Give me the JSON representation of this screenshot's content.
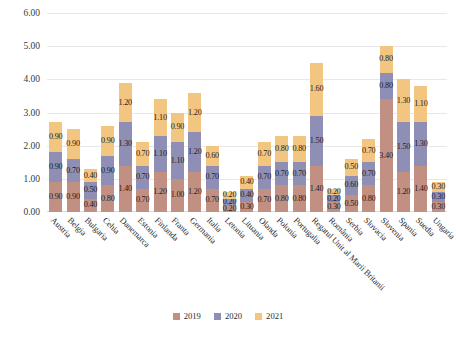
{
  "chart_data": {
    "type": "bar",
    "subtype": "stacked-bar",
    "title": "",
    "xlabel": "",
    "ylabel": "",
    "ylim": [
      0,
      6
    ],
    "yticks": [
      "0.00",
      "1.00",
      "2.00",
      "3.00",
      "4.00",
      "5.00",
      "6.00"
    ],
    "ytick_values": [
      0,
      1,
      2,
      3,
      4,
      5,
      6
    ],
    "grid": true,
    "legend_position": "bottom",
    "colors": {
      "2019": "#c29083",
      "2020": "#8f8fb5",
      "2021": "#f2c581"
    },
    "categories": [
      "Austria",
      "Belgia",
      "Bulgaria",
      "Cehia",
      "Danemarca",
      "Estonia",
      "Finlanda",
      "Franta",
      "Germania",
      "Italia",
      "Letonia",
      "Lituania",
      "Olanda",
      "Polonia",
      "Portugalia",
      "Regatul Unit al Marii Britanii",
      "România",
      "Serbia",
      "Slovacia",
      "Slovenia",
      "Spania",
      "Suedia",
      "Ungaria"
    ],
    "series": [
      {
        "name": "2019",
        "values": [
          0.9,
          0.9,
          0.4,
          0.8,
          1.4,
          0.7,
          1.2,
          1.0,
          1.2,
          0.7,
          0.2,
          0.3,
          0.7,
          0.8,
          0.8,
          1.4,
          0.3,
          0.5,
          0.8,
          3.4,
          1.2,
          1.4,
          0.3
        ],
        "labels": [
          "0.90",
          "0.90",
          "0.40",
          "0.80",
          "1.40",
          "0.70",
          "1.20",
          "1.00",
          "1.20",
          "0.70",
          "0.20",
          "0.30",
          "0.70",
          "0.80",
          "0.80",
          "1.40",
          "0.30",
          "0.50",
          "0.80",
          "3.40",
          "1.20",
          "1.40",
          "0.30"
        ]
      },
      {
        "name": "2020",
        "values": [
          0.9,
          0.7,
          0.5,
          0.9,
          1.3,
          0.7,
          1.1,
          1.1,
          1.2,
          0.7,
          0.2,
          0.4,
          0.7,
          0.7,
          0.7,
          1.5,
          0.2,
          0.6,
          0.7,
          0.8,
          1.5,
          1.3,
          0.3
        ],
        "labels": [
          "0.90",
          "0.70",
          "0.50",
          "0.90",
          "1.30",
          "0.70",
          "1.10",
          "1.10",
          "1.20",
          "0.70",
          "0.20",
          "0.40",
          "0.70",
          "0.70",
          "0.70",
          "1.50",
          "0.20",
          "0.60",
          "0.70",
          "0.80",
          "1.50",
          "1.30",
          "0.30"
        ]
      },
      {
        "name": "2021",
        "values": [
          0.9,
          0.9,
          0.4,
          0.9,
          1.2,
          0.7,
          1.1,
          0.9,
          1.2,
          0.6,
          0.2,
          0.4,
          0.7,
          0.8,
          0.8,
          1.6,
          0.2,
          0.5,
          0.7,
          0.8,
          1.3,
          1.1,
          0.3
        ],
        "labels": [
          "0.90",
          "0.90",
          "0.40",
          "0.90",
          "1.20",
          "0.70",
          "1.10",
          "0.90",
          "1.20",
          "0.60",
          "0.20",
          "0.40",
          "0.70",
          "0.80",
          "0.80",
          "1.60",
          "0.20",
          "0.50",
          "0.70",
          "0.80",
          "1.30",
          "1.10",
          "0.30"
        ]
      }
    ]
  },
  "legend": {
    "items": [
      {
        "label": "2019",
        "key": "s2019"
      },
      {
        "label": "2020",
        "key": "s2020"
      },
      {
        "label": "2021",
        "key": "s2021"
      }
    ]
  }
}
